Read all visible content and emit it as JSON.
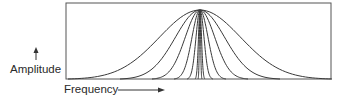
{
  "diagram": {
    "type": "spectral-envelope",
    "y_axis_label": "Amplitude",
    "x_axis_label": "Frequency",
    "y_arrow": "up-arrow",
    "x_arrow": "right-arrow",
    "line_color": "#3a3a3a",
    "box": {
      "x": 66,
      "y": 3,
      "width": 265,
      "height": 76
    },
    "peak": {
      "x": 200,
      "y": 10
    },
    "curves": [
      {
        "name": "curve-1",
        "half_width": 2
      },
      {
        "name": "curve-2",
        "half_width": 5
      },
      {
        "name": "curve-3",
        "half_width": 13
      },
      {
        "name": "curve-4",
        "half_width": 26
      },
      {
        "name": "curve-5",
        "half_width": 48
      },
      {
        "name": "curve-6",
        "half_width": 80
      },
      {
        "name": "curve-7",
        "half_width": 132
      }
    ]
  }
}
